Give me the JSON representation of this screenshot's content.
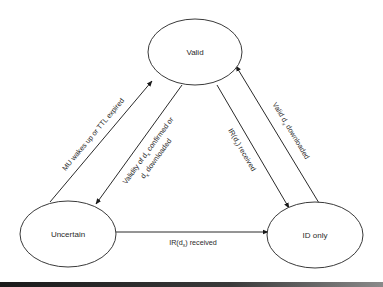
{
  "diagram": {
    "type": "state-transition",
    "states": [
      {
        "id": "valid",
        "label": "Valid"
      },
      {
        "id": "uncertain",
        "label": "Uncertain"
      },
      {
        "id": "id_only",
        "label": "ID only"
      }
    ],
    "transitions": [
      {
        "from": "uncertain",
        "to": "valid",
        "label": "MU wakes up or TTL expired"
      },
      {
        "from": "valid",
        "to": "uncertain",
        "label_line1_prefix": "Validity of d",
        "label_line1_sub": "x",
        "label_line1_suffix": " confirmed or",
        "label_line2_prefix": "d",
        "label_line2_sub": "x",
        "label_line2_suffix": " downloaded"
      },
      {
        "from": "valid",
        "to": "id_only",
        "label_prefix": "IR(d",
        "label_sub": "x",
        "label_suffix": ") received"
      },
      {
        "from": "id_only",
        "to": "valid",
        "label_prefix": "Valid d",
        "label_sub": "x",
        "label_suffix": " downloaded"
      },
      {
        "from": "uncertain",
        "to": "id_only",
        "label_prefix": "IR(d",
        "label_sub": "x",
        "label_suffix": ") received"
      }
    ]
  }
}
